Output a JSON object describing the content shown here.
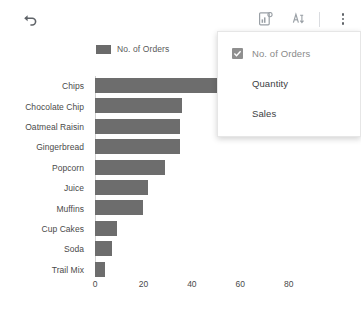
{
  "toolbar": {
    "undo_icon": "undo-icon",
    "chart_edit_icon": "chart-settings-icon",
    "color_icon": "theme-color-icon",
    "more_icon": "more-options-icon"
  },
  "legend": {
    "entries": [
      {
        "label": "No. of Orders",
        "color": "#6b6b6b"
      }
    ]
  },
  "menu": {
    "items": [
      {
        "label": "No. of Orders",
        "checked": true
      },
      {
        "label": "Quantity",
        "checked": false
      },
      {
        "label": "Sales",
        "checked": false
      }
    ]
  },
  "chart_data": {
    "type": "bar",
    "orientation": "horizontal",
    "title": "",
    "xlabel": "",
    "ylabel": "",
    "categories": [
      "Chips",
      "Chocolate Chip",
      "Oatmeal Raisin",
      "Gingerbread",
      "Popcorn",
      "Juice",
      "Muffins",
      "Cup Cakes",
      "Soda",
      "Trail Mix"
    ],
    "series": [
      {
        "name": "No. of Orders",
        "color": "#6d6d6d",
        "values": [
          63,
          36,
          35,
          35,
          29,
          22,
          20,
          9,
          7,
          4
        ]
      }
    ],
    "xticks": [
      0,
      20,
      40,
      60,
      80
    ],
    "xlim": [
      0,
      90
    ],
    "grid": false,
    "legend_position": "top"
  }
}
